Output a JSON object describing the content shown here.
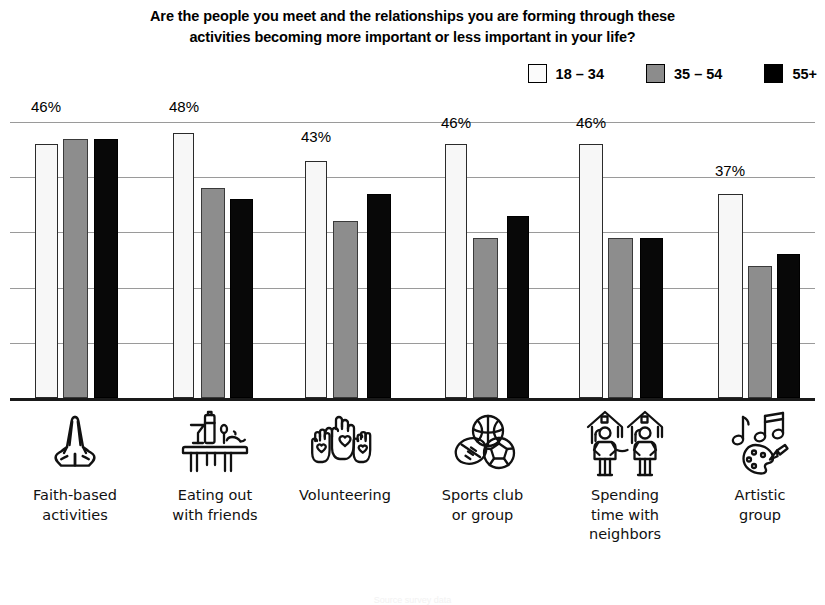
{
  "title": {
    "line1": "Are the people you meet and the relationships you are forming through these",
    "line2": "activities becoming more important or less important in your life?"
  },
  "legend": {
    "items": [
      {
        "label": "18 – 34",
        "swatch": "white",
        "color": "#fbfbfb"
      },
      {
        "label": "35 – 54",
        "swatch": "gray",
        "color": "#8c8c8c"
      },
      {
        "label": "55+",
        "swatch": "black",
        "color": "#000000"
      }
    ]
  },
  "categories": [
    {
      "icon": "praying-hands-icon",
      "label_lines": [
        "Faith-based",
        "activities"
      ]
    },
    {
      "icon": "dining-table-icon",
      "label_lines": [
        "Eating out",
        "with friends"
      ]
    },
    {
      "icon": "raised-hands-hearts-icon",
      "label_lines": [
        "Volunteering"
      ]
    },
    {
      "icon": "sports-balls-icon",
      "label_lines": [
        "Sports club",
        "or group"
      ]
    },
    {
      "icon": "neighbors-houses-icon",
      "label_lines": [
        "Spending",
        "time with",
        "neighbors"
      ]
    },
    {
      "icon": "music-palette-icon",
      "label_lines": [
        "Artistic",
        "group"
      ]
    }
  ],
  "chart_data": {
    "type": "bar",
    "title": "Are the people you meet and the relationships you are forming through these activities becoming more important or less important in your life?",
    "xlabel": "",
    "ylabel": "",
    "ylim": [
      0,
      50
    ],
    "grid": true,
    "gridlines": [
      10,
      20,
      30,
      40,
      50
    ],
    "legend_position": "top-right",
    "categories": [
      "Faith-based activities",
      "Eating out with friends",
      "Volunteering",
      "Sports club or group",
      "Spending time with neighbors",
      "Artistic group"
    ],
    "series": [
      {
        "name": "18 – 34",
        "color": "#fbfbfb",
        "values": [
          46,
          48,
          43,
          46,
          46,
          37
        ]
      },
      {
        "name": "35 – 54",
        "color": "#8c8c8c",
        "values": [
          47,
          38,
          32,
          29,
          29,
          24
        ]
      },
      {
        "name": "55+",
        "color": "#000000",
        "values": [
          47,
          36,
          37,
          33,
          29,
          26
        ]
      }
    ],
    "data_labels": [
      {
        "category": "Faith-based activities",
        "series": "18 – 34",
        "text": "46%"
      },
      {
        "category": "Eating out with friends",
        "series": "18 – 34",
        "text": "48%"
      },
      {
        "category": "Volunteering",
        "series": "18 – 34",
        "text": "43%"
      },
      {
        "category": "Sports club or group",
        "series": "18 – 34",
        "text": "46%"
      },
      {
        "category": "Spending time with neighbors",
        "series": "18 – 34",
        "text": "46%"
      },
      {
        "category": "Artistic group",
        "series": "18 – 34",
        "text": "37%"
      }
    ]
  },
  "geometry": {
    "baseline_y": 298,
    "px_per_unit": 5.52,
    "groups": [
      {
        "bars": [
          {
            "x": 25,
            "w": 23
          },
          {
            "x": 53,
            "w": 25
          },
          {
            "x": 84,
            "w": 24
          }
        ],
        "label_x": 36,
        "label_y": -2
      },
      {
        "bars": [
          {
            "x": 163,
            "w": 21
          },
          {
            "x": 191,
            "w": 24
          },
          {
            "x": 220,
            "w": 23
          }
        ],
        "label_x": 174,
        "label_y": -2
      },
      {
        "bars": [
          {
            "x": 295,
            "w": 22
          },
          {
            "x": 323,
            "w": 25
          },
          {
            "x": 357,
            "w": 24
          }
        ],
        "label_x": 306,
        "label_y": 28
      },
      {
        "bars": [
          {
            "x": 435,
            "w": 22
          },
          {
            "x": 463,
            "w": 25
          },
          {
            "x": 497,
            "w": 22
          }
        ],
        "label_x": 446,
        "label_y": 14
      },
      {
        "bars": [
          {
            "x": 569,
            "w": 24
          },
          {
            "x": 598,
            "w": 25
          },
          {
            "x": 630,
            "w": 23
          }
        ],
        "label_x": 581,
        "label_y": 14
      },
      {
        "bars": [
          {
            "x": 708,
            "w": 25
          },
          {
            "x": 738,
            "w": 24
          },
          {
            "x": 767,
            "w": 23
          }
        ],
        "label_x": 720,
        "label_y": 62
      }
    ],
    "cat_slots": [
      {
        "x": 0,
        "w": 150
      },
      {
        "x": 140,
        "w": 150
      },
      {
        "x": 265,
        "w": 160
      },
      {
        "x": 405,
        "w": 155
      },
      {
        "x": 545,
        "w": 160
      },
      {
        "x": 685,
        "w": 150
      }
    ]
  },
  "footnote": "Source survey data"
}
